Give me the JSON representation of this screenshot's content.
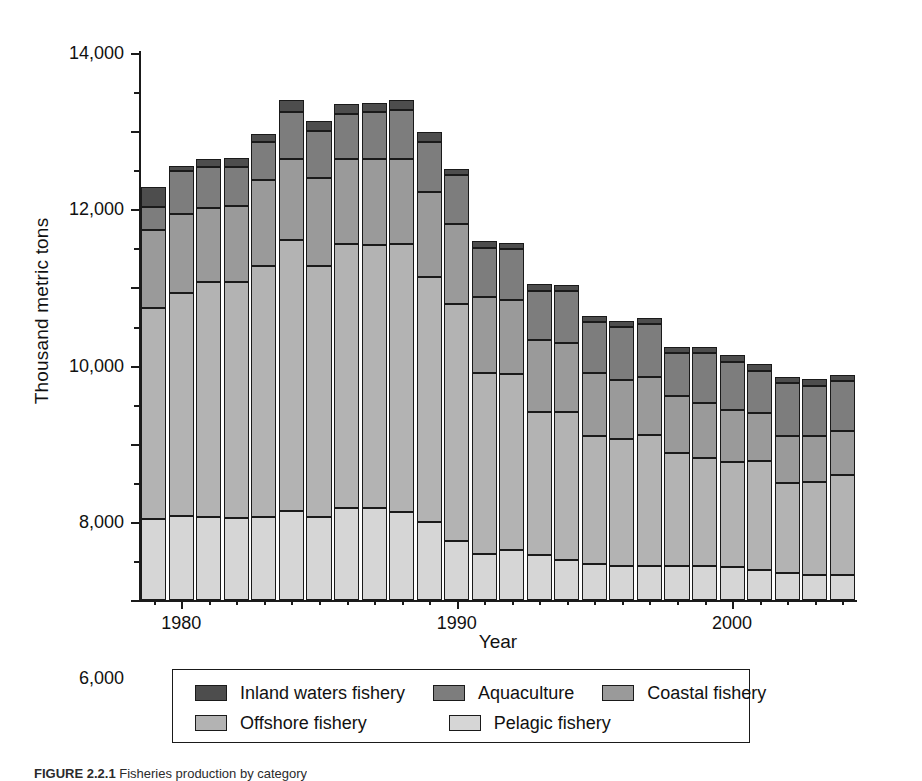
{
  "figure": {
    "caption": "FIGURE 2.2.1",
    "caption_rest": "  Fisheries production by category"
  },
  "chart_data": {
    "type": "bar",
    "subtype": "stacked-vertical",
    "title": "",
    "xlabel": "Year",
    "ylabel": "Thousand metric tons",
    "ylim": [
      0,
      14000
    ],
    "yticks": [
      0,
      2000,
      4000,
      6000,
      8000,
      10000,
      12000,
      14000
    ],
    "ytick_labels": [
      "0",
      "2,000",
      "4,000",
      "6,000",
      "8,000",
      "10,000",
      "12,000",
      "14,000"
    ],
    "y_minor_tick_step": 1000,
    "xlim": [
      1978.5,
      2004.5
    ],
    "xticks": [
      1980,
      1990,
      2000
    ],
    "xtick_labels": [
      "1980",
      "1990",
      "2000"
    ],
    "x_minor_tick_step": 1,
    "grid": false,
    "legend_position": "bottom",
    "categories": [
      1979,
      1980,
      1981,
      1982,
      1983,
      1984,
      1985,
      1986,
      1987,
      1988,
      1989,
      1990,
      1991,
      1992,
      1993,
      1994,
      1995,
      1996,
      1997,
      1998,
      1999,
      2000,
      2001,
      2002,
      2003,
      2004
    ],
    "series": [
      {
        "name": "Pelagic fishery",
        "color": "#d6d6d6",
        "values": [
          2070,
          2150,
          2130,
          2100,
          2130,
          2280,
          2130,
          2350,
          2360,
          2260,
          2000,
          1500,
          1180,
          1290,
          1150,
          1030,
          930,
          860,
          880,
          870,
          870,
          850,
          780,
          700,
          650,
          640
        ]
      },
      {
        "name": "Offshore fishery",
        "color": "#b3b3b3",
        "values": [
          5410,
          5700,
          6000,
          6030,
          6420,
          6930,
          6430,
          6750,
          6720,
          6860,
          6280,
          6070,
          4620,
          4490,
          3670,
          3790,
          3280,
          3250,
          3340,
          2890,
          2770,
          2670,
          2770,
          2290,
          2360,
          2560
        ]
      },
      {
        "name": "Coastal fishery",
        "color": "#9a9a9a",
        "values": [
          2000,
          2030,
          1900,
          1960,
          2190,
          2080,
          2240,
          2190,
          2200,
          2170,
          2160,
          2050,
          1950,
          1900,
          1830,
          1770,
          1600,
          1530,
          1500,
          1450,
          1390,
          1350,
          1230,
          1220,
          1180,
          1120
        ]
      },
      {
        "name": "Aquaculture",
        "color": "#7d7d7d",
        "values": [
          570,
          1100,
          1060,
          1000,
          970,
          1200,
          1200,
          1150,
          1210,
          1240,
          1280,
          1270,
          1270,
          1300,
          1270,
          1310,
          1310,
          1350,
          1340,
          1110,
          1290,
          1230,
          1090,
          1340,
          1300,
          1280
        ]
      },
      {
        "name": "Inland waters fishery",
        "color": "#4d4d4d",
        "values": [
          510,
          140,
          200,
          230,
          230,
          300,
          260,
          260,
          240,
          260,
          250,
          150,
          160,
          160,
          160,
          160,
          160,
          160,
          160,
          160,
          160,
          160,
          160,
          160,
          160,
          160
        ]
      }
    ],
    "legend_order": [
      "Inland waters fishery",
      "Aquaculture",
      "Coastal fishery",
      "Offshore fishery",
      "Pelagic fishery"
    ],
    "totals": [
      10560,
      11120,
      11290,
      11320,
      11940,
      12790,
      12260,
      12710,
      12730,
      12790,
      11970,
      11040,
      9180,
      9140,
      8080,
      8060,
      7280,
      7150,
      7220,
      6480,
      6480,
      6260,
      6030,
      5710,
      5650,
      5760
    ]
  }
}
